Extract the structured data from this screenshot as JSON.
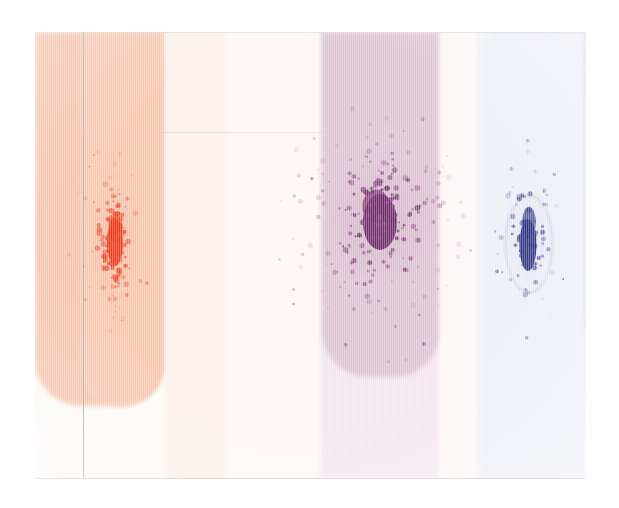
{
  "image": {
    "title": "Scanned chromatography plate — three dye lanes",
    "kind": "scan",
    "width": 619,
    "height": 508,
    "paper_color": "#ffffff",
    "plate": {
      "x": 35,
      "y": 32,
      "width": 551,
      "height": 447,
      "base_color": "#fdfaf7"
    }
  },
  "bands": [
    {
      "id": "lane-1-salmon",
      "label": "salmon lane",
      "x": 0,
      "width": 130,
      "height": 374,
      "color": "#f3bfa6",
      "rounded": true
    },
    {
      "id": "lane-1-salmon-r",
      "label": "salmon lane right",
      "x": 44,
      "width": 86,
      "height": 374,
      "color": "#f6c5ac",
      "rounded": true
    },
    {
      "id": "gap-1-cream",
      "label": "cream gap",
      "x": 130,
      "width": 62,
      "height": 447,
      "color": "#fbf0ea",
      "rounded": false
    },
    {
      "id": "gap-2-offwhite",
      "label": "off-white gap",
      "x": 192,
      "width": 93,
      "height": 447,
      "color": "#fdf7f4",
      "rounded": false
    },
    {
      "id": "lane-2-pale",
      "label": "pale lavender lane",
      "x": 285,
      "width": 120,
      "height": 447,
      "color": "#f2e6ee",
      "rounded": false
    },
    {
      "id": "lane-2-purple",
      "label": "purple lane",
      "x": 287,
      "width": 118,
      "height": 345,
      "color": "#dcc3d1",
      "rounded": true
    },
    {
      "id": "gap-3-white",
      "label": "white gap",
      "x": 405,
      "width": 48,
      "height": 447,
      "color": "#fcf6f6",
      "rounded": false
    },
    {
      "id": "lane-3-bluegray",
      "label": "blue-gray lane",
      "x": 453,
      "width": 98,
      "height": 330,
      "color": "#c0c3d6",
      "rounded": true
    },
    {
      "id": "lane-3-halo",
      "label": "blue-gray halo",
      "x": 443,
      "width": 108,
      "height": 447,
      "color": "#eceef6",
      "rounded": false
    }
  ],
  "rules": {
    "vertical_line": {
      "id": "pencil-rule",
      "x": 48,
      "color": "#b9a9a2"
    },
    "bottom_line": {
      "id": "plate-bottom-edge",
      "y": 446,
      "color": "#c9c3c0"
    },
    "top_line": {
      "id": "plate-top-edge",
      "y": 0,
      "color": "#d8d2ce"
    },
    "faint_cross": {
      "id": "faint-cross-rule",
      "x": 48,
      "y": 100,
      "width": 290,
      "color": "#d9c6bd"
    }
  },
  "spots": [
    {
      "id": "spot-red",
      "label": "red dye spot",
      "lane": "lane-1-salmon",
      "center_x": 80,
      "center_y": 210,
      "core_color": "#f03010",
      "speck_color": "#e8442a",
      "halo_color": "rgba(240,70,40,0.10)",
      "core_width": 16,
      "core_height": 48,
      "spread_x": 36,
      "spread_y": 78,
      "speck_count": 120,
      "shape": "vertical-streak"
    },
    {
      "id": "spot-purple",
      "label": "purple dye spot",
      "lane": "lane-2-purple",
      "center_x": 345,
      "center_y": 190,
      "core_color": "#6b2766",
      "speck_color": "#8a3f80",
      "halo_color": "rgba(120,50,110,0.10)",
      "core_width": 34,
      "core_height": 56,
      "spread_x": 82,
      "spread_y": 110,
      "speck_count": 190,
      "shape": "radial-spray"
    },
    {
      "id": "spot-blue",
      "label": "blue dye spot",
      "lane": "lane-3-bluegray",
      "center_x": 493,
      "center_y": 205,
      "core_color": "#2b2f7e",
      "speck_color": "#3b3f8c",
      "halo_color": "rgba(45,50,130,0.08)",
      "core_width": 17,
      "core_height": 52,
      "spread_x": 34,
      "spread_y": 82,
      "speck_count": 70,
      "shape": "blob-with-ring",
      "ring": {
        "width": 46,
        "height": 96,
        "color": "rgba(120,125,170,0.45)"
      }
    }
  ],
  "chart_data": {
    "type": "scatter",
    "xlabel": "",
    "ylabel": "",
    "series": [
      {
        "name": "red dye",
        "color": "#f03010",
        "n_points": 120,
        "centroid": [
          80,
          210
        ],
        "sigma": [
          9,
          20
        ]
      },
      {
        "name": "purple dye",
        "color": "#6b2766",
        "n_points": 190,
        "centroid": [
          345,
          190
        ],
        "sigma": [
          22,
          28
        ]
      },
      {
        "name": "blue dye",
        "color": "#2b2f7e",
        "n_points": 70,
        "centroid": [
          493,
          205
        ],
        "sigma": [
          9,
          22
        ]
      }
    ]
  }
}
